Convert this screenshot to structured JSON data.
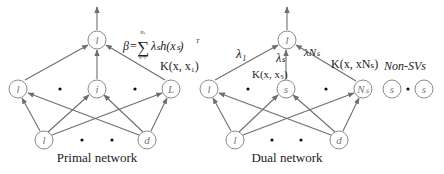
{
  "primal": {
    "caption": "Primal network",
    "output_node": "l",
    "hidden_nodes": [
      "l",
      "i",
      "L"
    ],
    "input_nodes": [
      "l",
      "d"
    ],
    "beta_formula": {
      "lhs": "β",
      "eq": "=",
      "sum": "∑",
      "upper": "Nₛ",
      "lower": "s=1",
      "term": "λₛh(xₛ)",
      "sup": "T"
    }
  },
  "dual": {
    "caption": "Dual network",
    "output_node": "l",
    "hidden_nodes": [
      "l",
      "s",
      "Nₛ"
    ],
    "input_nodes": [
      "l",
      "d"
    ],
    "weights": {
      "w1": "λ₁",
      "ws": "λₛ",
      "wN": "λNₛ"
    },
    "kernels": {
      "k1": "K(x, x₁)",
      "ks": "K(x, xₛ)",
      "kN": "K(x, xNₛ)"
    },
    "non_sv_label": "Non-SVs",
    "non_sv_nodes": [
      "s",
      "s"
    ]
  }
}
